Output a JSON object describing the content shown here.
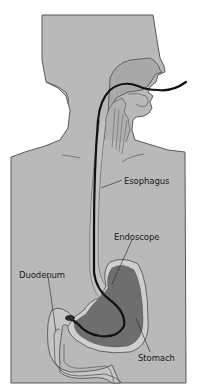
{
  "diagram": {
    "type": "anatomical-illustration",
    "labels": {
      "esophagus": "Esophagus",
      "endoscope": "Endoscope",
      "duodenum": "Duodenum",
      "stomach": "Stomach"
    },
    "colors": {
      "body_fill": "#b9b9b9",
      "outline": "#4a4a4a",
      "cavity_fill": "#a8a8a8",
      "stomach_dark": "#6e6e6e",
      "stomach_rim": "#cfcfcf",
      "duodenum_fill": "#c6c6c6",
      "endoscope": "#111111",
      "background": "#ffffff"
    }
  }
}
